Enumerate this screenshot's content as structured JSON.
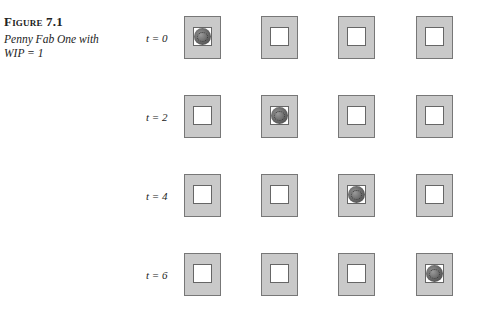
{
  "caption": {
    "figure_label": "Figure 7.1",
    "description_line1": "Penny Fab One with",
    "description_line2": "WIP = 1"
  },
  "rows": [
    {
      "label": "t = 0",
      "penny_station": 1
    },
    {
      "label": "t = 2",
      "penny_station": 2
    },
    {
      "label": "t = 4",
      "penny_station": 3
    },
    {
      "label": "t = 6",
      "penny_station": 4
    }
  ],
  "stations_per_row": 4,
  "colors": {
    "station_fill": "#c9c9c9",
    "station_border": "#777777",
    "slot_fill": "#ffffff",
    "penny": "#6d6d6d"
  }
}
